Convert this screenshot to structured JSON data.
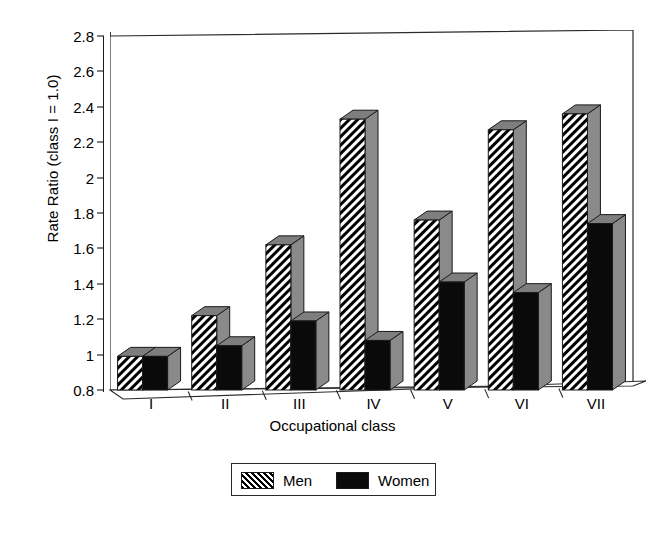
{
  "chart_data": {
    "type": "bar",
    "title": "",
    "xlabel": "Occupational class",
    "ylabel": "Rate Ratio (class I = 1.0)",
    "categories": [
      "I",
      "II",
      "III",
      "IV",
      "V",
      "VI",
      "VII"
    ],
    "series": [
      {
        "name": "Men",
        "values": [
          0.99,
          1.22,
          1.62,
          2.33,
          1.76,
          2.27,
          2.36
        ],
        "fill": "diagonal-hatch",
        "color": "#000000"
      },
      {
        "name": "Women",
        "values": [
          0.99,
          1.05,
          1.19,
          1.08,
          1.41,
          1.35,
          1.74
        ],
        "fill": "solid",
        "color": "#0a0a0a"
      }
    ],
    "ylim": [
      0.8,
      2.8
    ],
    "yticks": [
      "0.8",
      "1",
      "1.2",
      "1.4",
      "1.6",
      "1.8",
      "2",
      "2.2",
      "2.4",
      "2.6",
      "2.8"
    ],
    "ytick_values": [
      0.8,
      1.0,
      1.2,
      1.4,
      1.6,
      1.8,
      2.0,
      2.2,
      2.4,
      2.6,
      2.8
    ],
    "grid": false,
    "legend_position": "bottom-center",
    "style": "3d-bars-grayscale",
    "bar_side_color": "#8a8a8a",
    "bar_top_color": "#7e7e7e"
  },
  "legend": {
    "entries": [
      {
        "label": "Men",
        "swatch": "diagonal-hatch-swatch"
      },
      {
        "label": "Women",
        "swatch": "solid-black-swatch"
      }
    ]
  }
}
